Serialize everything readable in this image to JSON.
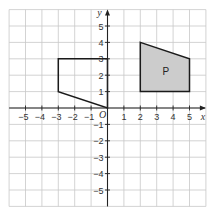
{
  "diagram": {
    "type": "coordinate-grid",
    "axes": {
      "x_label": "x",
      "y_label": "y",
      "origin_label": "O",
      "x_range": [
        -6,
        6
      ],
      "y_range": [
        -6,
        6
      ],
      "x_ticks": [
        -5,
        -4,
        -3,
        -2,
        -1,
        1,
        2,
        3,
        4,
        5
      ],
      "y_ticks": [
        5,
        4,
        3,
        2,
        1,
        -1,
        -2,
        -3,
        -4,
        -5
      ]
    },
    "shapes": [
      {
        "name": "unshaded-quadrilateral",
        "label": "",
        "filled": false,
        "vertices": [
          [
            -3,
            3
          ],
          [
            0,
            3
          ],
          [
            0,
            0
          ],
          [
            -3,
            1
          ]
        ]
      },
      {
        "name": "shape-P",
        "label": "P",
        "filled": true,
        "fill_color": "#cccccc",
        "vertices": [
          [
            2,
            4
          ],
          [
            5,
            3
          ],
          [
            5,
            1
          ],
          [
            2,
            1
          ]
        ]
      }
    ],
    "colors": {
      "grid": "#c8c8c8",
      "axis": "#222222",
      "shape_fill": "#cccccc"
    }
  }
}
